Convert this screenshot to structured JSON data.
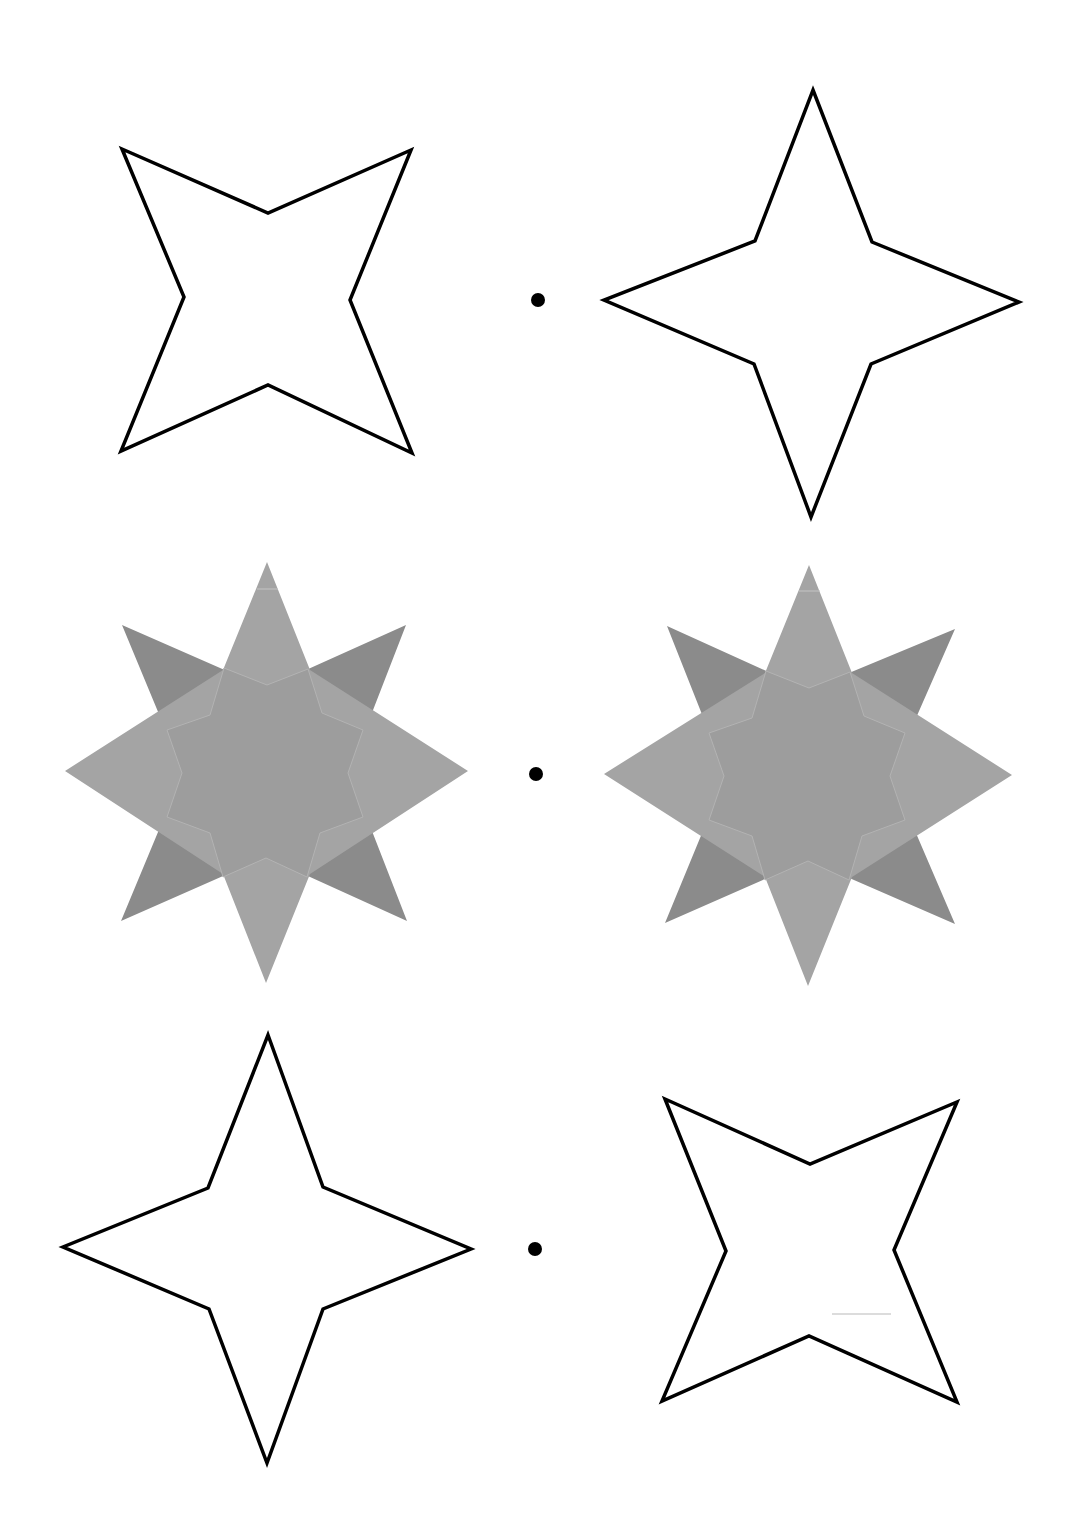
{
  "worksheet": {
    "rows": [
      {
        "left": "x-star-outline",
        "right": "plus-star-outline"
      },
      {
        "left": "eight-point-star-filled",
        "right": "eight-point-star-filled"
      },
      {
        "left": "plus-star-outline",
        "right": "x-star-outline"
      }
    ]
  },
  "colors": {
    "outline": "#000000",
    "background": "#ffffff",
    "x_star_fill": "#8b8b8b",
    "plus_star_fill": "#a4a4a4",
    "center_fill": "#9d9d9d",
    "seam": "#b8b8b8",
    "dot": "#000000"
  },
  "shapes": {
    "top_left_star_points": "122,149 268,213 411,150 350,300 412,453 268,385 121,451 184,297",
    "top_right_star_points": "813,90 872,242 1019,302 871,364 811,517 754,364 604,300 755,241",
    "bottom_left_star_points": "268,1035 323,1187 471,1249 323,1309 267,1463 209,1309 63,1247 208,1188",
    "bottom_right_star_points": "665,1099 810,1164 957,1102 894,1250 957,1402 809,1336 662,1401 726,1251",
    "mid_left_x_points": "122,625 266,688 406,625 349,772 407,921 266,857 121,921 183,772",
    "mid_left_plus_points": "267,562 310,670 468,771 310,874 266,983 223,874 65,771 223,670",
    "mid_left_center_points": "267,685 308,669 322,713 363,730 348,773 363,817 320,833 307,877 266,858 223,877 210,833 167,817 182,773 167,730 210,715 224,668",
    "mid_right_x_points": "667,626 808,690 955,629 891,775 955,924 808,860 665,923 726,775",
    "mid_right_plus_points": "809,565 852,673 1012,775 852,877 808,986 765,877 604,774 765,673",
    "mid_right_center_points": "809,688 850,672 864,716 905,733 890,776 905,820 862,836 849,880 808,861 765,880 752,836 709,820 724,776 709,733 752,718 766,671"
  },
  "dots": [
    {
      "cx": 538,
      "cy": 300,
      "r": 7
    },
    {
      "cx": 536,
      "cy": 774,
      "r": 7
    },
    {
      "cx": 535,
      "cy": 1249,
      "r": 7
    }
  ]
}
